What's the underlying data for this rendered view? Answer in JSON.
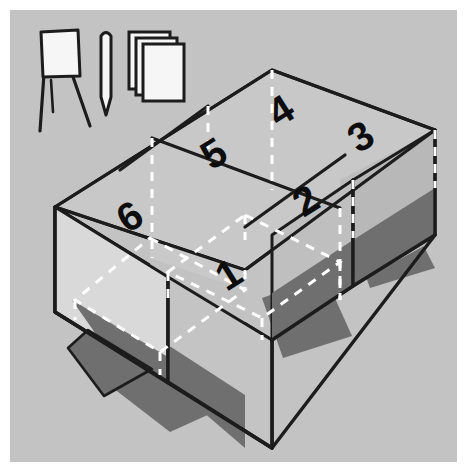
{
  "scene": {
    "title": "Isometric open-compartment grid puzzle",
    "background_color": "#ffffff",
    "panel_color": "#c3c3c3",
    "panel": {
      "x": 10,
      "y": 10,
      "width": 447,
      "height": 452
    }
  },
  "palette": {
    "outline": "#1c1c1c",
    "top_face": "#c8c8c8",
    "top_face_light": "#d2d2d2",
    "wall_outer_left": "#d6d6d6",
    "wall_outer_right": "#b4b4b4",
    "wall_inner": "#bdbdbd",
    "floor_dark": "#6f6f6f",
    "floor_dark_2": "#767676",
    "dashed_line": "#ffffff",
    "paper_white": "#f4f4f4",
    "digit_color": "#0d0d0d"
  },
  "grid": {
    "rows": 2,
    "cols": 3,
    "description": "3 by 2 array of open-topped compartments drawn in isometric projection",
    "cells": [
      {
        "number": "4",
        "row": 0,
        "col": 2,
        "label_x": 288,
        "label_y": 122,
        "rotation": -32,
        "font_size": 40
      },
      {
        "number": "3",
        "row": 1,
        "col": 2,
        "label_x": 368,
        "label_y": 148,
        "rotation": -32,
        "font_size": 40
      },
      {
        "number": "5",
        "row": 0,
        "col": 1,
        "label_x": 221,
        "label_y": 165,
        "rotation": -32,
        "font_size": 40
      },
      {
        "number": "2",
        "row": 1,
        "col": 1,
        "label_x": 313,
        "label_y": 212,
        "rotation": -32,
        "font_size": 40
      },
      {
        "number": "6",
        "row": 0,
        "col": 0,
        "label_x": 137,
        "label_y": 228,
        "rotation": -32,
        "font_size": 40
      },
      {
        "number": "1",
        "row": 1,
        "col": 0,
        "label_x": 236,
        "label_y": 286,
        "rotation": -32,
        "font_size": 40
      }
    ],
    "numbers_in_reading_order": [
      "1",
      "2",
      "3",
      "4",
      "5",
      "6"
    ]
  },
  "geometry": {
    "apex_top": {
      "x": 272,
      "y": 70
    },
    "vertex_left": {
      "x": 55,
      "y": 207
    },
    "vertex_right": {
      "x": 435,
      "y": 130
    },
    "vertex_bottom": {
      "x": 245,
      "y": 448
    }
  },
  "icons": {
    "easel": {
      "name": "flipchart-easel-icon",
      "board": {
        "x": 40,
        "y": 31,
        "width": 38,
        "height": 45
      },
      "fill": "#f6f6f6"
    },
    "pencil": {
      "name": "pencil-icon",
      "x": 101,
      "y": 31,
      "width": 10,
      "height": 84,
      "fill": "#f6f6f6"
    },
    "papers": {
      "name": "paper-stack-icon",
      "count": 3,
      "x": 128,
      "y": 31,
      "width": 44,
      "height": 60,
      "fill": "#f6f6f6"
    }
  }
}
